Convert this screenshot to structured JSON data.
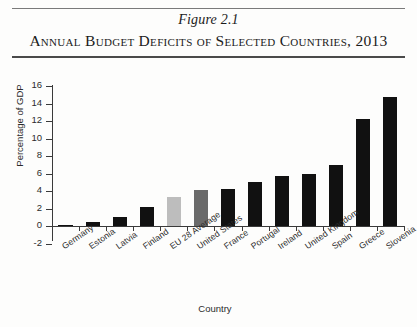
{
  "header": {
    "figure_number": "Figure 2.1",
    "title": "Annual Budget Deficits of Selected Countries, 2013"
  },
  "chart_data": {
    "type": "bar",
    "title": "Annual Budget Deficits of Selected Countries, 2013",
    "xlabel": "Country",
    "ylabel": "Percentage of GDP",
    "ylim": [
      -2,
      16
    ],
    "ytick_labels": [
      "16",
      "14",
      "12",
      "10",
      "8",
      "6",
      "4",
      "2",
      "0",
      "-2"
    ],
    "ytick_values": [
      16,
      14,
      12,
      10,
      8,
      6,
      4,
      2,
      0,
      -2
    ],
    "grid": false,
    "legend": "none",
    "categories": [
      "Germany",
      "Estonia",
      "Latvia",
      "Finland",
      "EU 28 Average",
      "United States",
      "France",
      "Portugal",
      "Ireland",
      "United Kingdom",
      "Spain",
      "Greece",
      "Slovenia"
    ],
    "values": [
      0.1,
      0.5,
      1.0,
      2.2,
      3.3,
      4.1,
      4.2,
      5.0,
      5.7,
      5.9,
      7.0,
      12.2,
      14.7
    ],
    "bar_colors": [
      "#111111",
      "#111111",
      "#111111",
      "#111111",
      "#bdbdbd",
      "#6a6a6a",
      "#111111",
      "#111111",
      "#111111",
      "#111111",
      "#111111",
      "#111111",
      "#111111"
    ]
  },
  "colors": {
    "bar_default": "#111111",
    "bar_eu_average": "#bdbdbd",
    "bar_united_states": "#6a6a6a",
    "axis": "#3a3a3a",
    "rule": "#4a4a4a"
  }
}
